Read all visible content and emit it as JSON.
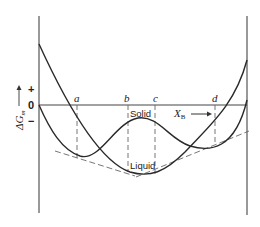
{
  "diagram": {
    "y_axis_label": "ΔG",
    "y_axis_subscript": "m",
    "y_plus": "+",
    "y_zero": "0",
    "y_minus": "−",
    "x_axis_label": "X",
    "x_axis_subscript": "B",
    "points": [
      "a",
      "b",
      "c",
      "d"
    ],
    "curve_labels": {
      "solid": "Solid",
      "liquid": "Liquid"
    },
    "colors": {
      "line": "#2a2a2a",
      "axis": "#555555",
      "dashed": "#666666"
    }
  }
}
